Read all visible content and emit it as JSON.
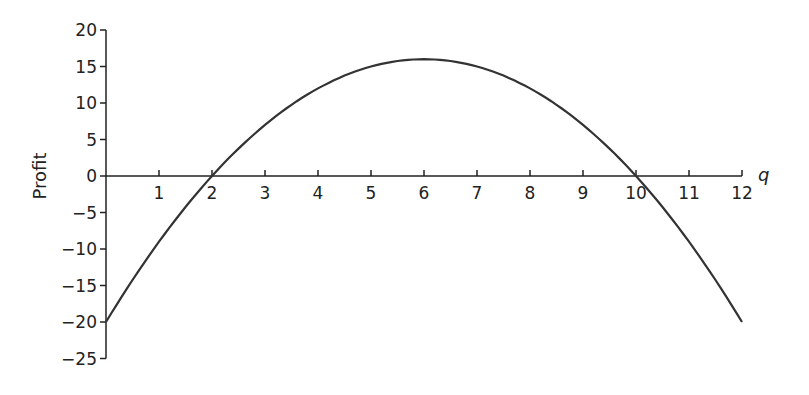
{
  "chart_data": {
    "type": "line",
    "title": "",
    "xlabel": "q",
    "ylabel": "Profit",
    "xlim": [
      0,
      12
    ],
    "ylim": [
      -25,
      20
    ],
    "x_ticks": [
      1,
      2,
      3,
      4,
      5,
      6,
      7,
      8,
      9,
      10,
      11,
      12
    ],
    "y_ticks": [
      20,
      15,
      10,
      5,
      0,
      -5,
      -10,
      -15,
      -20,
      -25
    ],
    "grid": false,
    "series": [
      {
        "name": "Profit",
        "function": "-q^2 + 12q - 20",
        "x": [
          0,
          1,
          2,
          3,
          4,
          5,
          6,
          7,
          8,
          9,
          10,
          11,
          12
        ],
        "values": [
          -20,
          -9,
          0,
          7,
          12,
          15,
          16,
          15,
          12,
          7,
          0,
          -9,
          -20
        ]
      }
    ]
  },
  "labels": {
    "x": "q",
    "y": "Profit"
  }
}
